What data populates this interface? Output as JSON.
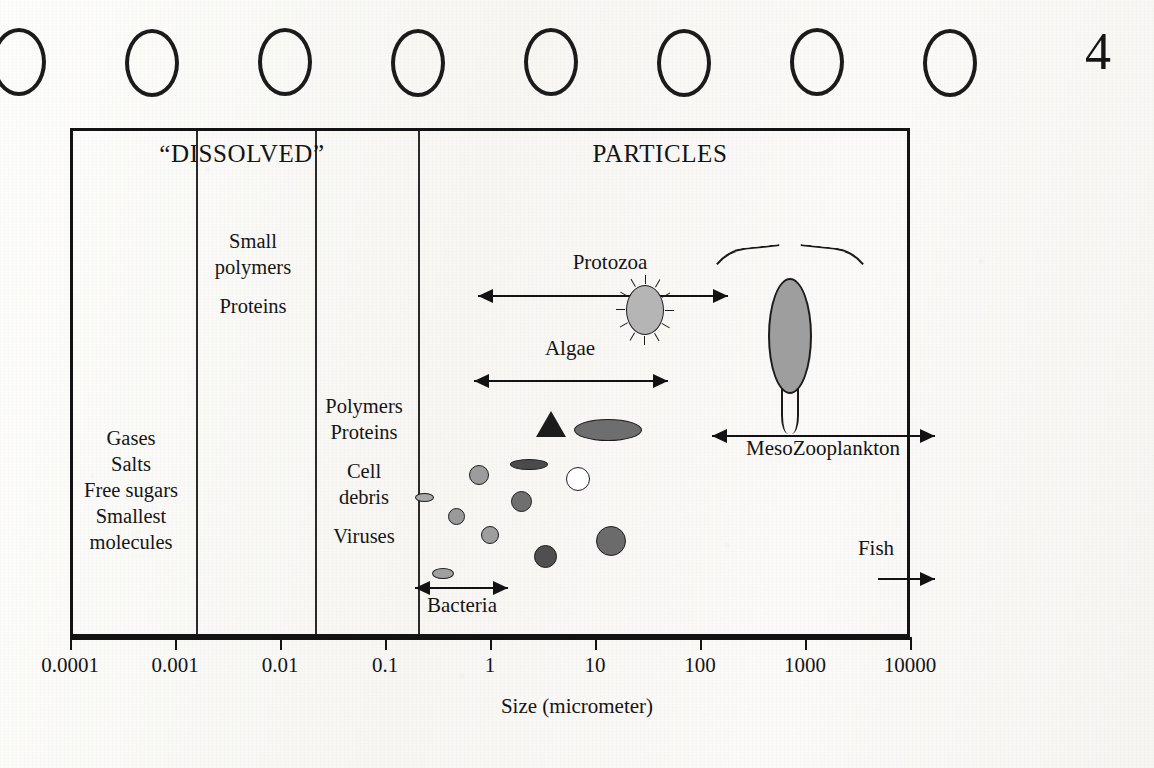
{
  "page": {
    "page_number": "4",
    "binding_holes": 8
  },
  "chart_data": {
    "type": "scatter",
    "xlabel": "Size (micrometer)",
    "ylabel": "",
    "xscale": "log",
    "xlim": [
      0.0001,
      10000
    ],
    "grid": false,
    "legend": "none",
    "tick_labels": [
      "0.0001",
      "0.001",
      "0.01",
      "0.1",
      "1",
      "10",
      "100",
      "1000",
      "10000"
    ],
    "tick_values": [
      0.0001,
      0.001,
      0.01,
      0.1,
      1,
      10,
      100,
      1000,
      10000
    ],
    "sections": [
      {
        "name": "dissolved",
        "label": "“DISSOLVED”",
        "x_center_px": 242
      },
      {
        "name": "particles",
        "label": "PARTICLES",
        "x_center_px": 660
      }
    ],
    "column_dividers_px": [
      193,
      312,
      415
    ],
    "columns": [
      {
        "name": "smallest-molecules-column",
        "x_center_px": 131,
        "y_top_px": 425,
        "lines": [
          "Gases",
          "Salts",
          "Free sugars",
          "Smallest",
          "molecules"
        ]
      },
      {
        "name": "small-polymers-column",
        "x_center_px": 253,
        "y_top_px": 228,
        "lines": [
          "Small",
          "polymers",
          "",
          "Proteins"
        ]
      },
      {
        "name": "polymers-viruses-column",
        "x_center_px": 364,
        "y_top_px": 393,
        "lines": [
          "Polymers",
          "Proteins",
          "",
          "Cell",
          "debris",
          "",
          "Viruses"
        ]
      }
    ],
    "ranges": [
      {
        "name": "protozoa",
        "label": "Protozoa",
        "x_start": 2,
        "x_end": 200,
        "left_head": true,
        "right_head": true,
        "line_px": [
          478,
          728
        ],
        "y_px": 295,
        "label_x_px": 610,
        "label_y_px": 262
      },
      {
        "name": "algae",
        "label": "Algae",
        "x_start": 1.6,
        "x_end": 60,
        "left_head": true,
        "right_head": true,
        "line_px": [
          474,
          668
        ],
        "y_px": 380,
        "label_x_px": 570,
        "label_y_px": 348
      },
      {
        "name": "mesozooplankton",
        "label": "MesoZooplankton",
        "x_start": 200,
        "x_end": 20000,
        "left_head": true,
        "right_head": true,
        "line_px": [
          712,
          935
        ],
        "y_px": 435,
        "label_x_px": 823,
        "label_y_px": 448
      },
      {
        "name": "fish",
        "label": "Fish",
        "x_start": 9000,
        "x_end": 20000,
        "left_head": false,
        "right_head": true,
        "line_px": [
          878,
          935
        ],
        "y_px": 578,
        "label_x_px": 876,
        "label_y_px": 548
      },
      {
        "name": "bacteria",
        "label": "Bacteria",
        "x_start": 0.2,
        "x_end": 1.2,
        "left_head": true,
        "right_head": true,
        "line_px": [
          415,
          508
        ],
        "y_px": 587,
        "label_x_px": 462,
        "label_y_px": 605
      }
    ],
    "particles": [
      {
        "name": "cell",
        "shape": "ellipse",
        "x_px": 424,
        "y_px": 497,
        "w": 19,
        "h": 9,
        "fill": "#a8a8a8"
      },
      {
        "name": "cell",
        "shape": "ellipse",
        "x_px": 443,
        "y_px": 573,
        "w": 22,
        "h": 11,
        "fill": "#a0a0a0"
      },
      {
        "name": "cell",
        "shape": "circle",
        "x_px": 456,
        "y_px": 516,
        "w": 17,
        "h": 17,
        "fill": "#9a9a9a"
      },
      {
        "name": "cell",
        "shape": "circle",
        "x_px": 479,
        "y_px": 475,
        "w": 20,
        "h": 20,
        "fill": "#9c9c9c"
      },
      {
        "name": "cell",
        "shape": "circle",
        "x_px": 490,
        "y_px": 535,
        "w": 18,
        "h": 18,
        "fill": "#9e9e9e"
      },
      {
        "name": "cell",
        "shape": "circle",
        "x_px": 521,
        "y_px": 501,
        "w": 21,
        "h": 21,
        "fill": "#6f6f6f"
      },
      {
        "name": "cell",
        "shape": "circle",
        "x_px": 545,
        "y_px": 556,
        "w": 23,
        "h": 23,
        "fill": "#4f4f4f"
      },
      {
        "name": "cell",
        "shape": "circle",
        "x_px": 578,
        "y_px": 479,
        "w": 24,
        "h": 24,
        "fill": "#ffffff"
      },
      {
        "name": "cell",
        "shape": "circle",
        "x_px": 611,
        "y_px": 541,
        "w": 30,
        "h": 30,
        "fill": "#6b6b6b"
      },
      {
        "name": "cell",
        "shape": "ellipse",
        "x_px": 529,
        "y_px": 464,
        "w": 38,
        "h": 11,
        "fill": "#4a4a4a"
      },
      {
        "name": "cell",
        "shape": "ellipse",
        "x_px": 608,
        "y_px": 430,
        "w": 68,
        "h": 22,
        "fill": "#6e6e6e"
      },
      {
        "name": "cell",
        "shape": "triangle",
        "x_px": 551,
        "y_px": 424,
        "w": 30,
        "h": 26,
        "fill": "#1c1c1c"
      }
    ],
    "organisms": [
      {
        "name": "ciliate",
        "label": "protozoan ciliate",
        "x_px": 645,
        "y_px": 310,
        "w": 56,
        "h": 62,
        "fill": "#b5b5b5"
      },
      {
        "name": "copepod",
        "label": "mesozooplankton copepod",
        "x_px": 790,
        "y_px": 236,
        "w": 96,
        "h": 210,
        "fill": "#9e9e9e"
      }
    ]
  }
}
